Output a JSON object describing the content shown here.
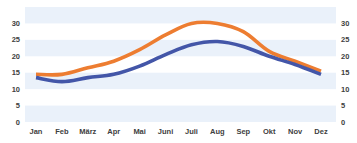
{
  "chart_data": {
    "type": "line",
    "title": "",
    "xlabel": "",
    "ylabel": "",
    "categories": [
      "Jan",
      "Feb",
      "März",
      "Apr",
      "Mai",
      "Juni",
      "Juli",
      "Aug",
      "Sep",
      "Okt",
      "Nov",
      "Dez"
    ],
    "series": [
      {
        "name": "Upper series",
        "color": "#ED7D31",
        "values": [
          14.5,
          14.5,
          16.5,
          18.5,
          22,
          26.5,
          30,
          30,
          27.5,
          21.5,
          18.5,
          15.5
        ]
      },
      {
        "name": "Lower series",
        "color": "#4356A8",
        "values": [
          13.5,
          12.3,
          13.5,
          14.5,
          17,
          20.5,
          23.5,
          24.5,
          23,
          20,
          17.5,
          14.5
        ]
      }
    ],
    "ylim": [
      0,
      35
    ],
    "yticks": [
      0,
      5,
      10,
      15,
      20,
      25,
      30
    ],
    "y_axis_left": true,
    "y_axis_right": true,
    "grid": "alternating horizontal bands",
    "band_color": "#EAF1FA",
    "legend": "none"
  }
}
